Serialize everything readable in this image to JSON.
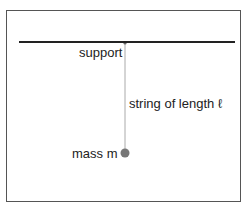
{
  "diagram": {
    "labels": {
      "support": "support",
      "string": "string of length ℓ",
      "mass": "mass m"
    },
    "colors": {
      "frame": "#555555",
      "support_line": "#222222",
      "string": "#aaaaaa",
      "mass": "#777777",
      "text": "#222222"
    },
    "geometry": {
      "support_y": 42,
      "support_x1": 19,
      "support_x2": 235,
      "pivot_x": 125,
      "mass_y": 153,
      "mass_radius": 4.5
    }
  }
}
